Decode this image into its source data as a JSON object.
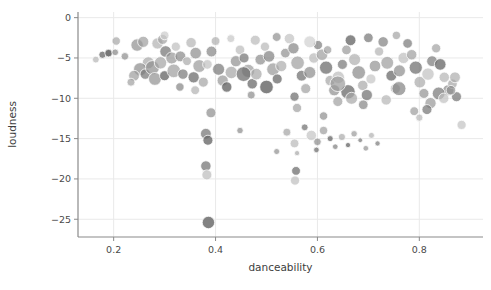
{
  "chart_data": {
    "type": "scatter",
    "title": "",
    "xlabel": "danceability",
    "ylabel": "loudness",
    "xlim": [
      0.13,
      0.925
    ],
    "ylim": [
      -27.2,
      0.7
    ],
    "xticks": [
      0.2,
      0.4,
      0.6,
      0.8
    ],
    "xticklabels": [
      "0.2",
      "0.4",
      "0.6",
      "0.8"
    ],
    "yticks": [
      0,
      -5,
      -10,
      -15,
      -20,
      -25
    ],
    "yticklabels": [
      "0",
      "−5",
      "−10",
      "−15",
      "−20",
      "−25"
    ],
    "grid": true,
    "grid_color": "#e9e9e9",
    "legend": "none",
    "marker": "circle",
    "marker_edge_color": "#ffffff",
    "palette": [
      "#9a9a9a",
      "#7d7d7d",
      "#b5b5b5",
      "#6a6a6a",
      "#c9c9c9",
      "#8a8a8a",
      "#a8a8a8",
      "#5f5f5f"
    ],
    "size_encoding": "bubble-radius-varies",
    "points": [
      {
        "x": 0.165,
        "y": -5.2,
        "r": 3.4,
        "c": "#b9b9b9",
        "o": 0.75
      },
      {
        "x": 0.178,
        "y": -4.6,
        "r": 3.6,
        "c": "#6e6e6e",
        "o": 0.8
      },
      {
        "x": 0.19,
        "y": -4.4,
        "r": 3.8,
        "c": "#5e5e5e",
        "o": 0.85
      },
      {
        "x": 0.203,
        "y": -4.3,
        "r": 3.3,
        "c": "#8d8d8d",
        "o": 0.75
      },
      {
        "x": 0.246,
        "y": -3.4,
        "r": 6.2,
        "c": "#8f8f8f",
        "o": 0.7
      },
      {
        "x": 0.258,
        "y": -3.0,
        "r": 5.6,
        "c": "#9d9d9d",
        "o": 0.7
      },
      {
        "x": 0.268,
        "y": -5.6,
        "r": 6.0,
        "c": "#a6a6a6",
        "o": 0.7
      },
      {
        "x": 0.252,
        "y": -6.4,
        "r": 6.6,
        "c": "#8a8a8a",
        "o": 0.7
      },
      {
        "x": 0.24,
        "y": -7.2,
        "r": 5.4,
        "c": "#9b9b9b",
        "o": 0.7
      },
      {
        "x": 0.262,
        "y": -7.0,
        "r": 5.2,
        "c": "#7c7c7c",
        "o": 0.75
      },
      {
        "x": 0.276,
        "y": -6.2,
        "r": 7.0,
        "c": "#8d8d8d",
        "o": 0.7
      },
      {
        "x": 0.286,
        "y": -3.2,
        "r": 5.6,
        "c": "#b0b0b0",
        "o": 0.7
      },
      {
        "x": 0.296,
        "y": -2.7,
        "r": 5.0,
        "c": "#9f9f9f",
        "o": 0.7
      },
      {
        "x": 0.302,
        "y": -4.2,
        "r": 5.8,
        "c": "#7a7a7a",
        "o": 0.75
      },
      {
        "x": 0.292,
        "y": -5.6,
        "r": 6.2,
        "c": "#a3a3a3",
        "o": 0.7
      },
      {
        "x": 0.281,
        "y": -7.6,
        "r": 6.4,
        "c": "#909090",
        "o": 0.7
      },
      {
        "x": 0.3,
        "y": -7.2,
        "r": 5.0,
        "c": "#6d6d6d",
        "o": 0.8
      },
      {
        "x": 0.314,
        "y": -5.0,
        "r": 6.0,
        "c": "#969696",
        "o": 0.7
      },
      {
        "x": 0.322,
        "y": -3.6,
        "r": 4.6,
        "c": "#bdbdbd",
        "o": 0.7
      },
      {
        "x": 0.331,
        "y": -4.8,
        "r": 5.4,
        "c": "#888888",
        "o": 0.7
      },
      {
        "x": 0.318,
        "y": -6.6,
        "r": 6.8,
        "c": "#9c9c9c",
        "o": 0.7
      },
      {
        "x": 0.336,
        "y": -7.0,
        "r": 5.2,
        "c": "#7f7f7f",
        "o": 0.75
      },
      {
        "x": 0.344,
        "y": -5.4,
        "r": 4.4,
        "c": "#a9a9a9",
        "o": 0.7
      },
      {
        "x": 0.352,
        "y": -3.1,
        "r": 5.2,
        "c": "#b4b4b4",
        "o": 0.7
      },
      {
        "x": 0.361,
        "y": -4.4,
        "r": 5.8,
        "c": "#8b8b8b",
        "o": 0.7
      },
      {
        "x": 0.368,
        "y": -6.0,
        "r": 6.4,
        "c": "#999999",
        "o": 0.7
      },
      {
        "x": 0.357,
        "y": -7.4,
        "r": 5.6,
        "c": "#727272",
        "o": 0.78
      },
      {
        "x": 0.376,
        "y": -8.0,
        "r": 5.0,
        "c": "#a2a2a2",
        "o": 0.7
      },
      {
        "x": 0.384,
        "y": -5.8,
        "r": 4.8,
        "c": "#c0c0c0",
        "o": 0.7
      },
      {
        "x": 0.392,
        "y": -4.2,
        "r": 5.4,
        "c": "#878787",
        "o": 0.72
      },
      {
        "x": 0.4,
        "y": -2.9,
        "r": 4.4,
        "c": "#aeaeae",
        "o": 0.7
      },
      {
        "x": 0.406,
        "y": -6.4,
        "r": 6.0,
        "c": "#7e7e7e",
        "o": 0.75
      },
      {
        "x": 0.414,
        "y": -7.8,
        "r": 5.6,
        "c": "#959595",
        "o": 0.7
      },
      {
        "x": 0.422,
        "y": -8.6,
        "r": 5.2,
        "c": "#686868",
        "o": 0.8
      },
      {
        "x": 0.431,
        "y": -6.8,
        "r": 6.2,
        "c": "#a4a4a4",
        "o": 0.7
      },
      {
        "x": 0.44,
        "y": -5.4,
        "r": 5.6,
        "c": "#8e8e8e",
        "o": 0.7
      },
      {
        "x": 0.448,
        "y": -4.0,
        "r": 4.8,
        "c": "#bababa",
        "o": 0.7
      },
      {
        "x": 0.456,
        "y": -5.0,
        "r": 5.0,
        "c": "#7b7b7b",
        "o": 0.75
      },
      {
        "x": 0.464,
        "y": -6.6,
        "r": 6.6,
        "c": "#9a9a9a",
        "o": 0.7
      },
      {
        "x": 0.472,
        "y": -8.2,
        "r": 5.2,
        "c": "#6f6f6f",
        "o": 0.78
      },
      {
        "x": 0.48,
        "y": -7.0,
        "r": 5.8,
        "c": "#a7a7a7",
        "o": 0.7
      },
      {
        "x": 0.488,
        "y": -5.2,
        "r": 5.4,
        "c": "#8c8c8c",
        "o": 0.7
      },
      {
        "x": 0.497,
        "y": -3.6,
        "r": 4.6,
        "c": "#b6b6b6",
        "o": 0.7
      },
      {
        "x": 0.505,
        "y": -4.8,
        "r": 5.8,
        "c": "#838383",
        "o": 0.73
      },
      {
        "x": 0.513,
        "y": -6.4,
        "r": 6.4,
        "c": "#979797",
        "o": 0.7
      },
      {
        "x": 0.521,
        "y": -7.6,
        "r": 5.0,
        "c": "#707070",
        "o": 0.78
      },
      {
        "x": 0.529,
        "y": -6.0,
        "r": 5.6,
        "c": "#ababab",
        "o": 0.7
      },
      {
        "x": 0.537,
        "y": -4.4,
        "r": 4.8,
        "c": "#8f8f8f",
        "o": 0.7
      },
      {
        "x": 0.545,
        "y": -2.6,
        "r": 5.2,
        "c": "#c2c2c2",
        "o": 0.7
      },
      {
        "x": 0.553,
        "y": -3.8,
        "r": 5.6,
        "c": "#868686",
        "o": 0.72
      },
      {
        "x": 0.561,
        "y": -5.6,
        "r": 6.8,
        "c": "#9e9e9e",
        "o": 0.7
      },
      {
        "x": 0.569,
        "y": -7.2,
        "r": 5.4,
        "c": "#767676",
        "o": 0.76
      },
      {
        "x": 0.577,
        "y": -8.8,
        "r": 5.0,
        "c": "#a0a0a0",
        "o": 0.7
      },
      {
        "x": 0.585,
        "y": -6.8,
        "r": 6.0,
        "c": "#8a8a8a",
        "o": 0.7
      },
      {
        "x": 0.593,
        "y": -5.0,
        "r": 5.2,
        "c": "#b8b8b8",
        "o": 0.7
      },
      {
        "x": 0.601,
        "y": -3.4,
        "r": 4.6,
        "c": "#818181",
        "o": 0.74
      },
      {
        "x": 0.609,
        "y": -4.6,
        "r": 5.8,
        "c": "#9c9c9c",
        "o": 0.7
      },
      {
        "x": 0.617,
        "y": -6.2,
        "r": 6.6,
        "c": "#737373",
        "o": 0.78
      },
      {
        "x": 0.625,
        "y": -7.8,
        "r": 5.2,
        "c": "#a5a5a5",
        "o": 0.7
      },
      {
        "x": 0.633,
        "y": -9.0,
        "r": 5.6,
        "c": "#8d8d8d",
        "o": 0.7
      },
      {
        "x": 0.641,
        "y": -7.4,
        "r": 6.2,
        "c": "#bcbcbc",
        "o": 0.7
      },
      {
        "x": 0.649,
        "y": -5.8,
        "r": 5.0,
        "c": "#7d7d7d",
        "o": 0.75
      },
      {
        "x": 0.657,
        "y": -4.0,
        "r": 4.8,
        "c": "#999999",
        "o": 0.7
      },
      {
        "x": 0.665,
        "y": -2.8,
        "r": 5.4,
        "c": "#6b6b6b",
        "o": 0.8
      },
      {
        "x": 0.673,
        "y": -5.2,
        "r": 6.0,
        "c": "#aeaeae",
        "o": 0.7
      },
      {
        "x": 0.681,
        "y": -6.8,
        "r": 6.8,
        "c": "#878787",
        "o": 0.7
      },
      {
        "x": 0.689,
        "y": -8.4,
        "r": 5.2,
        "c": "#a8a8a8",
        "o": 0.7
      },
      {
        "x": 0.697,
        "y": -9.6,
        "r": 5.6,
        "c": "#787878",
        "o": 0.76
      },
      {
        "x": 0.705,
        "y": -7.6,
        "r": 5.0,
        "c": "#c4c4c4",
        "o": 0.7
      },
      {
        "x": 0.713,
        "y": -6.0,
        "r": 5.8,
        "c": "#919191",
        "o": 0.7
      },
      {
        "x": 0.721,
        "y": -4.2,
        "r": 4.6,
        "c": "#b2b2b2",
        "o": 0.7
      },
      {
        "x": 0.729,
        "y": -3.0,
        "r": 5.2,
        "c": "#848484",
        "o": 0.73
      },
      {
        "x": 0.737,
        "y": -5.6,
        "r": 6.4,
        "c": "#9b9b9b",
        "o": 0.7
      },
      {
        "x": 0.745,
        "y": -7.2,
        "r": 5.4,
        "c": "#717171",
        "o": 0.78
      },
      {
        "x": 0.753,
        "y": -8.8,
        "r": 5.0,
        "c": "#a6a6a6",
        "o": 0.7
      },
      {
        "x": 0.761,
        "y": -6.6,
        "r": 6.0,
        "c": "#8b8b8b",
        "o": 0.7
      },
      {
        "x": 0.769,
        "y": -5.0,
        "r": 5.6,
        "c": "#bebebe",
        "o": 0.7
      },
      {
        "x": 0.777,
        "y": -3.2,
        "r": 4.8,
        "c": "#7f7f7f",
        "o": 0.75
      },
      {
        "x": 0.785,
        "y": -4.6,
        "r": 5.2,
        "c": "#9d9d9d",
        "o": 0.7
      },
      {
        "x": 0.793,
        "y": -6.2,
        "r": 6.6,
        "c": "#757575",
        "o": 0.77
      },
      {
        "x": 0.801,
        "y": -8.0,
        "r": 5.8,
        "c": "#a9a9a9",
        "o": 0.7
      },
      {
        "x": 0.809,
        "y": -9.4,
        "r": 5.0,
        "c": "#929292",
        "o": 0.7
      },
      {
        "x": 0.817,
        "y": -7.0,
        "r": 6.2,
        "c": "#c0c0c0",
        "o": 0.7
      },
      {
        "x": 0.825,
        "y": -5.4,
        "r": 5.4,
        "c": "#808080",
        "o": 0.74
      },
      {
        "x": 0.833,
        "y": -3.8,
        "r": 4.6,
        "c": "#a1a1a1",
        "o": 0.7
      },
      {
        "x": 0.841,
        "y": -5.8,
        "r": 5.8,
        "c": "#6e6e6e",
        "o": 0.8
      },
      {
        "x": 0.849,
        "y": -7.4,
        "r": 5.2,
        "c": "#b3b3b3",
        "o": 0.7
      },
      {
        "x": 0.857,
        "y": -9.0,
        "r": 5.6,
        "c": "#898989",
        "o": 0.7
      },
      {
        "x": 0.865,
        "y": -8.2,
        "r": 4.8,
        "c": "#a4a4a4",
        "o": 0.7
      },
      {
        "x": 0.873,
        "y": -9.8,
        "r": 5.0,
        "c": "#7a7a7a",
        "o": 0.75
      },
      {
        "x": 0.62,
        "y": -4.0,
        "r": 4.2,
        "c": "#9a9a9a",
        "o": 0.68
      },
      {
        "x": 0.43,
        "y": -2.6,
        "r": 4.0,
        "c": "#c6c6c6",
        "o": 0.7
      },
      {
        "x": 0.52,
        "y": -2.4,
        "r": 4.4,
        "c": "#8f8f8f",
        "o": 0.7
      },
      {
        "x": 0.7,
        "y": -2.5,
        "r": 4.8,
        "c": "#7c7c7c",
        "o": 0.75
      },
      {
        "x": 0.755,
        "y": -2.2,
        "r": 4.2,
        "c": "#a2a2a2",
        "o": 0.7
      },
      {
        "x": 0.36,
        "y": -9.0,
        "r": 4.4,
        "c": "#b0b0b0",
        "o": 0.7
      },
      {
        "x": 0.47,
        "y": -9.6,
        "r": 4.0,
        "c": "#8a8a8a",
        "o": 0.7
      },
      {
        "x": 0.555,
        "y": -9.8,
        "r": 4.6,
        "c": "#757575",
        "o": 0.76
      },
      {
        "x": 0.64,
        "y": -10.4,
        "r": 5.0,
        "c": "#9e9e9e",
        "o": 0.7
      },
      {
        "x": 0.69,
        "y": -10.8,
        "r": 4.8,
        "c": "#868686",
        "o": 0.72
      },
      {
        "x": 0.735,
        "y": -10.2,
        "r": 5.2,
        "c": "#b5b5b5",
        "o": 0.7
      },
      {
        "x": 0.66,
        "y": -9.2,
        "r": 7.2,
        "c": "#707070",
        "o": 0.78
      },
      {
        "x": 0.667,
        "y": -10.0,
        "r": 6.0,
        "c": "#a7a7a7",
        "o": 0.7
      },
      {
        "x": 0.822,
        "y": -10.6,
        "r": 5.6,
        "c": "#979797",
        "o": 0.7
      },
      {
        "x": 0.838,
        "y": -9.4,
        "r": 6.4,
        "c": "#7e7e7e",
        "o": 0.75
      },
      {
        "x": 0.848,
        "y": -10.0,
        "r": 5.2,
        "c": "#c1c1c1",
        "o": 0.7
      },
      {
        "x": 0.862,
        "y": -9.0,
        "r": 4.8,
        "c": "#909090",
        "o": 0.7
      },
      {
        "x": 0.391,
        "y": -11.8,
        "r": 5.0,
        "c": "#8b8b8b",
        "o": 0.7
      },
      {
        "x": 0.56,
        "y": -11.2,
        "r": 4.6,
        "c": "#a0a0a0",
        "o": 0.7
      },
      {
        "x": 0.612,
        "y": -12.2,
        "r": 4.2,
        "c": "#8d8d8d",
        "o": 0.7
      },
      {
        "x": 0.79,
        "y": -11.6,
        "r": 4.4,
        "c": "#9b9b9b",
        "o": 0.7
      },
      {
        "x": 0.815,
        "y": -11.4,
        "r": 5.0,
        "c": "#7b7b7b",
        "o": 0.75
      },
      {
        "x": 0.8,
        "y": -12.4,
        "r": 3.6,
        "c": "#b7b7b7",
        "o": 0.7
      },
      {
        "x": 0.381,
        "y": -14.4,
        "r": 5.4,
        "c": "#7f7f7f",
        "o": 0.78
      },
      {
        "x": 0.385,
        "y": -15.2,
        "r": 5.0,
        "c": "#6a6a6a",
        "o": 0.8
      },
      {
        "x": 0.448,
        "y": -14.0,
        "r": 3.2,
        "c": "#8e8e8e",
        "o": 0.72
      },
      {
        "x": 0.54,
        "y": -14.2,
        "r": 4.0,
        "c": "#a3a3a3",
        "o": 0.7
      },
      {
        "x": 0.555,
        "y": -15.6,
        "r": 4.4,
        "c": "#b8b8b8",
        "o": 0.7
      },
      {
        "x": 0.575,
        "y": -13.6,
        "r": 3.4,
        "c": "#777777",
        "o": 0.76
      },
      {
        "x": 0.588,
        "y": -14.6,
        "r": 5.2,
        "c": "#c3c3c3",
        "o": 0.7
      },
      {
        "x": 0.6,
        "y": -15.4,
        "r": 3.8,
        "c": "#8a8a8a",
        "o": 0.7
      },
      {
        "x": 0.612,
        "y": -14.0,
        "r": 4.2,
        "c": "#9d9d9d",
        "o": 0.7
      },
      {
        "x": 0.625,
        "y": -15.0,
        "r": 3.0,
        "c": "#6f6f6f",
        "o": 0.8
      },
      {
        "x": 0.635,
        "y": -16.0,
        "r": 2.8,
        "c": "#858585",
        "o": 0.75
      },
      {
        "x": 0.648,
        "y": -14.8,
        "r": 3.6,
        "c": "#aaaaaa",
        "o": 0.7
      },
      {
        "x": 0.66,
        "y": -15.8,
        "r": 2.6,
        "c": "#6d6d6d",
        "o": 0.8
      },
      {
        "x": 0.672,
        "y": -14.4,
        "r": 3.2,
        "c": "#999999",
        "o": 0.7
      },
      {
        "x": 0.684,
        "y": -15.2,
        "r": 2.4,
        "c": "#7c7c7c",
        "o": 0.75
      },
      {
        "x": 0.695,
        "y": -16.2,
        "r": 2.8,
        "c": "#929292",
        "o": 0.7
      },
      {
        "x": 0.706,
        "y": -14.6,
        "r": 3.0,
        "c": "#b1b1b1",
        "o": 0.7
      },
      {
        "x": 0.718,
        "y": -15.6,
        "r": 2.6,
        "c": "#808080",
        "o": 0.74
      },
      {
        "x": 0.52,
        "y": -16.6,
        "r": 3.0,
        "c": "#8f8f8f",
        "o": 0.7
      },
      {
        "x": 0.56,
        "y": -16.8,
        "r": 2.6,
        "c": "#a6a6a6",
        "o": 0.7
      },
      {
        "x": 0.598,
        "y": -16.4,
        "r": 2.8,
        "c": "#747474",
        "o": 0.78
      },
      {
        "x": 0.883,
        "y": -13.3,
        "r": 4.6,
        "c": "#c5c5c5",
        "o": 0.75
      },
      {
        "x": 0.381,
        "y": -18.4,
        "r": 5.2,
        "c": "#7f7f7f",
        "o": 0.8
      },
      {
        "x": 0.383,
        "y": -19.5,
        "r": 5.0,
        "c": "#bfbfbf",
        "o": 0.75
      },
      {
        "x": 0.558,
        "y": -19.0,
        "r": 4.4,
        "c": "#787878",
        "o": 0.8
      },
      {
        "x": 0.556,
        "y": -20.2,
        "r": 4.6,
        "c": "#c2c2c2",
        "o": 0.75
      },
      {
        "x": 0.386,
        "y": -25.4,
        "r": 6.2,
        "c": "#6c6c6c",
        "o": 0.85
      },
      {
        "x": 0.205,
        "y": -2.9,
        "r": 4.2,
        "c": "#a5a5a5",
        "o": 0.7
      },
      {
        "x": 0.222,
        "y": -4.8,
        "r": 3.8,
        "c": "#8b8b8b",
        "o": 0.7
      },
      {
        "x": 0.234,
        "y": -8.0,
        "r": 4.0,
        "c": "#9f9f9f",
        "o": 0.7
      },
      {
        "x": 0.33,
        "y": -8.6,
        "r": 4.2,
        "c": "#878787",
        "o": 0.72
      },
      {
        "x": 0.455,
        "y": -7.0,
        "r": 7.4,
        "c": "#6f6f6f",
        "o": 0.75
      },
      {
        "x": 0.5,
        "y": -8.6,
        "r": 6.8,
        "c": "#636363",
        "o": 0.8
      },
      {
        "x": 0.64,
        "y": -8.2,
        "r": 7.8,
        "c": "#9a9a9a",
        "o": 0.7
      },
      {
        "x": 0.76,
        "y": -8.8,
        "r": 7.0,
        "c": "#858585",
        "o": 0.72
      },
      {
        "x": 0.585,
        "y": -3.0,
        "r": 6.0,
        "c": "#d0d0d0",
        "o": 0.7
      },
      {
        "x": 0.3,
        "y": -2.2,
        "r": 4.4,
        "c": "#cacaca",
        "o": 0.7
      },
      {
        "x": 0.478,
        "y": -2.8,
        "r": 5.0,
        "c": "#b9b9b9",
        "o": 0.7
      },
      {
        "x": 0.87,
        "y": -7.4,
        "r": 5.4,
        "c": "#acacac",
        "o": 0.7
      }
    ]
  },
  "plot_area": {
    "left": 78,
    "right": 483,
    "top": 12,
    "bottom": 237,
    "background": "#ffffff",
    "spine_color": "#8a8a8a"
  }
}
